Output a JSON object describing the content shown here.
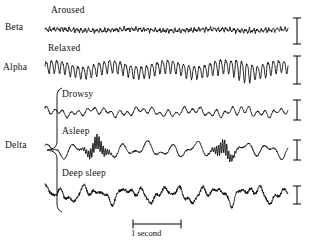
{
  "figure": {
    "background": "#ffffff",
    "trace_color": "#000000",
    "time_scale": {
      "label": "1 second",
      "x_start": 133,
      "x_end": 181,
      "y": 224
    }
  },
  "band_labels": [
    {
      "name": "beta",
      "text": "Beta",
      "x": 5,
      "y": 28
    },
    {
      "name": "alpha",
      "text": "Alpha",
      "x": 3,
      "y": 68
    },
    {
      "name": "delta",
      "text": "Delta",
      "x": 5,
      "y": 146
    }
  ],
  "brace": {
    "name": "delta-brace",
    "top": 88,
    "bottom": 212,
    "spine_x": 57,
    "tip_x": 47,
    "tip_y": 150
  },
  "traces": [
    {
      "name": "aroused",
      "state_label": "Aroused",
      "band": "Beta",
      "label_x": 51,
      "label_y": 14,
      "baseline": 30,
      "x_start": 45,
      "x_end": 288,
      "amplitude": 4.0,
      "frequency": 62,
      "style": "fast-low-amplitude",
      "scale_bar": {
        "x": 297,
        "y_top": 18,
        "y_bottom": 44,
        "cap_half_width": 4
      }
    },
    {
      "name": "relaxed",
      "state_label": "Relaxed",
      "band": "Alpha",
      "label_x": 48,
      "label_y": 52,
      "baseline": 69,
      "x_start": 45,
      "x_end": 288,
      "amplitude": 14.0,
      "frequency": 46,
      "style": "alpha-spindles",
      "scale_bar": {
        "x": 297,
        "y_top": 56,
        "y_bottom": 84,
        "cap_half_width": 4
      }
    },
    {
      "name": "drowsy",
      "state_label": "Drowsy",
      "band": "Delta",
      "label_x": 62,
      "label_y": 98,
      "baseline": 112,
      "x_start": 45,
      "x_end": 288,
      "amplitude": 7.0,
      "frequency": 30,
      "style": "mixed-theta",
      "scale_bar": {
        "x": 297,
        "y_top": 100,
        "y_bottom": 120,
        "cap_half_width": 4
      }
    },
    {
      "name": "asleep",
      "state_label": "Asleep",
      "band": "Delta",
      "label_x": 62,
      "label_y": 135,
      "baseline": 150,
      "x_start": 45,
      "x_end": 288,
      "amplitude": 9.0,
      "frequency": 10,
      "style": "slow-with-spindles",
      "scale_bar": {
        "x": 297,
        "y_top": 140,
        "y_bottom": 160,
        "cap_half_width": 4
      }
    },
    {
      "name": "deep-sleep",
      "state_label": "Deep sleep",
      "band": "Delta",
      "label_x": 62,
      "label_y": 177,
      "baseline": 194,
      "x_start": 45,
      "x_end": 288,
      "amplitude": 16.0,
      "frequency": 6,
      "style": "large-slow-delta",
      "scale_bar": {
        "x": 297,
        "y_top": 186,
        "y_bottom": 204,
        "cap_half_width": 4
      }
    }
  ],
  "chart_data": {
    "type": "line",
    "xlabel": "Time",
    "ylabel": "EEG amplitude",
    "grid": false,
    "legend": "none",
    "x_scale_label": "1 second",
    "categories": [
      "Aroused",
      "Relaxed",
      "Drowsy",
      "Asleep",
      "Deep sleep"
    ],
    "series": [
      {
        "name": "Aroused",
        "band": "Beta",
        "description": "Low-amplitude, high-frequency desynchronized beta activity",
        "relative_amplitude": 4,
        "relative_frequency": 62
      },
      {
        "name": "Relaxed",
        "band": "Alpha",
        "description": "Rhythmic alpha waves showing waxing and waning spindle envelopes",
        "relative_amplitude": 14,
        "relative_frequency": 46
      },
      {
        "name": "Drowsy",
        "band": "Delta",
        "description": "Mixed theta activity of intermediate amplitude and frequency",
        "relative_amplitude": 7,
        "relative_frequency": 30
      },
      {
        "name": "Asleep",
        "band": "Delta",
        "description": "Slow background waves interrupted by brief sleep-spindle bursts",
        "relative_amplitude": 9,
        "relative_frequency": 10
      },
      {
        "name": "Deep sleep",
        "band": "Delta",
        "description": "Large-amplitude slow delta waves",
        "relative_amplitude": 16,
        "relative_frequency": 6
      }
    ]
  }
}
